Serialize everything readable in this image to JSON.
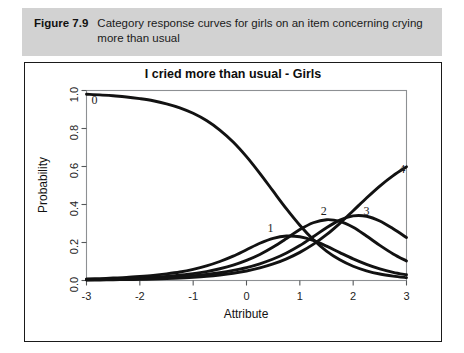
{
  "figure": {
    "number": "Figure 7.9",
    "caption": "Category response curves for girls on an item concerning crying more than usual"
  },
  "chart_data": {
    "type": "line",
    "title": "I cried more than usual - Girls",
    "xlabel": "Attribute",
    "ylabel": "Probability",
    "xlim": [
      -3,
      3
    ],
    "ylim": [
      0,
      1
    ],
    "xticks": [
      -3,
      -2,
      -1,
      0,
      1,
      2,
      3
    ],
    "xtick_labels": [
      "-3",
      "-2",
      "-1",
      "0",
      "1",
      "2",
      "3"
    ],
    "yticks": [
      0.0,
      0.2,
      0.4,
      0.6,
      0.8,
      1.0
    ],
    "ytick_labels": [
      "0.0",
      "0.2",
      "0.4",
      "0.6",
      "0.8",
      "1.0"
    ],
    "grid": false,
    "legend": "none",
    "annotations": [
      {
        "label": "0",
        "x": -2.85,
        "y": 0.93
      },
      {
        "label": "1",
        "x": 0.45,
        "y": 0.255
      },
      {
        "label": "2",
        "x": 1.45,
        "y": 0.345
      },
      {
        "label": "3",
        "x": 2.25,
        "y": 0.345
      },
      {
        "label": "4",
        "x": 2.92,
        "y": 0.565
      }
    ],
    "x": [
      -3.0,
      -2.75,
      -2.5,
      -2.25,
      -2.0,
      -1.75,
      -1.5,
      -1.25,
      -1.0,
      -0.75,
      -0.5,
      -0.25,
      0.0,
      0.25,
      0.5,
      0.75,
      1.0,
      1.25,
      1.5,
      1.75,
      2.0,
      2.25,
      2.5,
      2.75,
      3.0
    ],
    "series": [
      {
        "name": "0",
        "values": [
          0.98,
          0.977,
          0.972,
          0.966,
          0.957,
          0.946,
          0.93,
          0.909,
          0.88,
          0.842,
          0.792,
          0.729,
          0.652,
          0.564,
          0.47,
          0.377,
          0.291,
          0.216,
          0.155,
          0.109,
          0.075,
          0.051,
          0.034,
          0.023,
          0.015
        ]
      },
      {
        "name": "1",
        "values": [
          0.008,
          0.01,
          0.013,
          0.016,
          0.021,
          0.027,
          0.035,
          0.045,
          0.059,
          0.077,
          0.1,
          0.128,
          0.162,
          0.196,
          0.222,
          0.234,
          0.23,
          0.211,
          0.181,
          0.147,
          0.114,
          0.085,
          0.061,
          0.043,
          0.03
        ]
      },
      {
        "name": "2",
        "values": [
          0.005,
          0.006,
          0.008,
          0.01,
          0.013,
          0.016,
          0.021,
          0.028,
          0.036,
          0.047,
          0.062,
          0.081,
          0.106,
          0.137,
          0.176,
          0.221,
          0.268,
          0.304,
          0.32,
          0.311,
          0.28,
          0.234,
          0.185,
          0.14,
          0.103
        ]
      },
      {
        "name": "3",
        "values": [
          0.004,
          0.005,
          0.006,
          0.007,
          0.009,
          0.012,
          0.015,
          0.019,
          0.025,
          0.032,
          0.041,
          0.053,
          0.068,
          0.088,
          0.113,
          0.145,
          0.184,
          0.23,
          0.278,
          0.318,
          0.34,
          0.338,
          0.313,
          0.272,
          0.226
        ]
      },
      {
        "name": "4",
        "values": [
          0.003,
          0.003,
          0.004,
          0.005,
          0.006,
          0.008,
          0.01,
          0.013,
          0.017,
          0.022,
          0.029,
          0.038,
          0.05,
          0.066,
          0.087,
          0.114,
          0.148,
          0.19,
          0.241,
          0.301,
          0.367,
          0.434,
          0.497,
          0.552,
          0.598
        ]
      }
    ]
  }
}
